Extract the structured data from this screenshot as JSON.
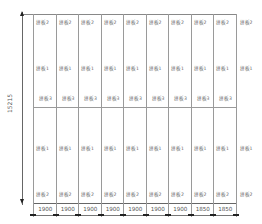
{
  "diagram": {
    "type": "panel-layout",
    "overall_height_dim": "15215",
    "columns": [
      {
        "width": "1900",
        "top": "拼板2",
        "mid": "拼板1",
        "low": "拼板3",
        "b_mid": "拼板1",
        "b_bot": "拼板2"
      },
      {
        "width": "1900",
        "top": "拼板2",
        "mid": "拼板1",
        "low": "拼板3",
        "b_mid": "拼板1",
        "b_bot": "拼板2"
      },
      {
        "width": "1900",
        "top": "拼板2",
        "mid": "拼板1",
        "low": "拼板3",
        "b_mid": "拼板1",
        "b_bot": "拼板2"
      },
      {
        "width": "1900",
        "top": "拼板2",
        "mid": "拼板1",
        "low": "拼板3",
        "b_mid": "拼板1",
        "b_bot": "拼板2"
      },
      {
        "width": "1900",
        "top": "拼板2",
        "mid": "拼板1",
        "low": "拼板3",
        "b_mid": "拼板1",
        "b_bot": "拼板2"
      },
      {
        "width": "1900",
        "top": "拼板2",
        "mid": "拼板1",
        "low": "拼板3",
        "b_mid": "拼板1",
        "b_bot": "拼板2"
      },
      {
        "width": "1900",
        "top": "拼板2",
        "mid": "拼板1",
        "low": "拼板3",
        "b_mid": "拼板1",
        "b_bot": "拼板2"
      },
      {
        "width": "1850",
        "top": "拼板2",
        "mid": "拼板1",
        "low": "拼板3",
        "b_mid": "拼板1",
        "b_bot": "拼板2"
      },
      {
        "width": "1850",
        "top": "拼板2",
        "mid": "拼板1",
        "low": "拼板3",
        "b_mid": "拼板1",
        "b_bot": "拼板2"
      }
    ],
    "edge_strip": {
      "top": "拼板2",
      "mid": "拼板1",
      "b_mid": "拼板1",
      "b_bot": "拼板2"
    }
  }
}
